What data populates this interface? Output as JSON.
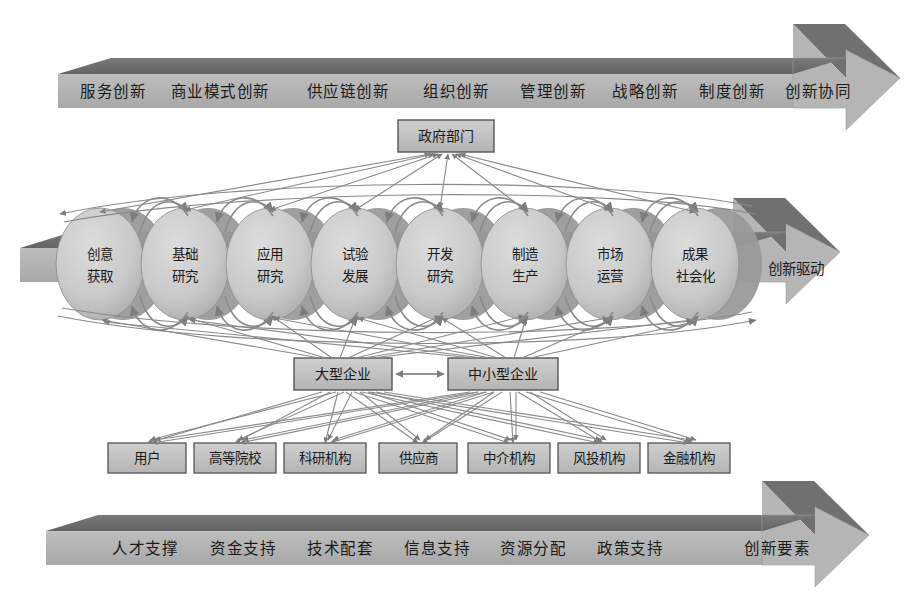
{
  "figure": {
    "background": "#ffffff",
    "palette": {
      "band_top_face": "#6e6e6e",
      "band_front_face": "#b3b3b3",
      "band_head_light": "#b9b9b9",
      "band_head_dark": "#7a7a7a",
      "node_fill": "#c0c0c0",
      "node_stroke": "#4a4a4a",
      "cylinder_fill": "#c9c9c9",
      "cylinder_shadow": "#8f8f8f",
      "connector": "#7d7d7d",
      "text": "#1a1a1a"
    }
  },
  "top_band": {
    "name": "创新类型带",
    "tag": "",
    "items": [
      "服务创新",
      "商业模式创新",
      "供应链创新",
      "组织创新",
      "管理创新",
      "战略创新",
      "制度创新",
      "创新协同"
    ]
  },
  "middle_band": {
    "name": "创新价值链",
    "tag": "创新驱动",
    "stages": [
      "创意\n获取",
      "基础\n研究",
      "应用\n研究",
      "试验\n发展",
      "开发\n研究",
      "制造\n生产",
      "市场\n运营",
      "成果\n社会化"
    ],
    "stage_lines": [
      [
        "创意",
        "获取"
      ],
      [
        "基础",
        "研究"
      ],
      [
        "应用",
        "研究"
      ],
      [
        "试验",
        "发展"
      ],
      [
        "开发",
        "研究"
      ],
      [
        "制造",
        "生产"
      ],
      [
        "市场",
        "运营"
      ],
      [
        "成果",
        "社会化"
      ]
    ]
  },
  "bottom_band": {
    "name": "创新要素带",
    "tag": "创新要素",
    "items": [
      "人才支撑",
      "资金支持",
      "技术配套",
      "信息支持",
      "资源分配",
      "政策支持"
    ]
  },
  "government": {
    "label": "政府部门"
  },
  "enterprises": [
    {
      "label": "大型企业"
    },
    {
      "label": "中小型企业"
    }
  ],
  "actors": [
    {
      "label": "用户"
    },
    {
      "label": "高等院校"
    },
    {
      "label": "科研机构"
    },
    {
      "label": "供应商"
    },
    {
      "label": "中介机构"
    },
    {
      "label": "风投机构"
    },
    {
      "label": "金融机构"
    }
  ]
}
